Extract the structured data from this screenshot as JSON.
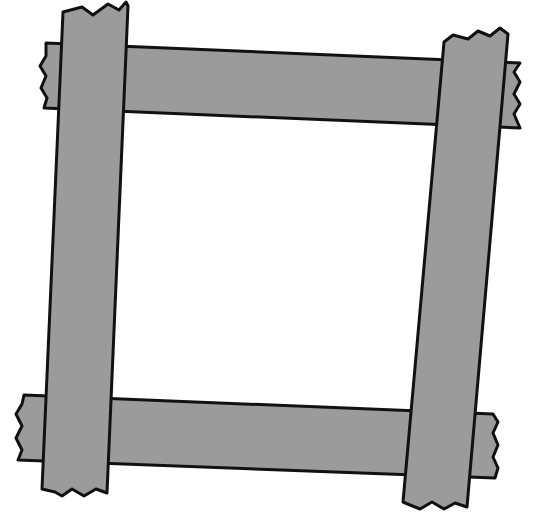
{
  "figure": {
    "colors": {
      "plank_fill": "#9b9b9b",
      "outline": "#111111",
      "background": "#ffffff"
    },
    "planks": [
      {
        "name": "top-plank",
        "orientation": "horizontal",
        "layer": "back"
      },
      {
        "name": "bottom-plank",
        "orientation": "horizontal",
        "layer": "back"
      },
      {
        "name": "left-post",
        "orientation": "vertical",
        "layer": "front"
      },
      {
        "name": "right-post",
        "orientation": "vertical",
        "layer": "front"
      }
    ]
  }
}
